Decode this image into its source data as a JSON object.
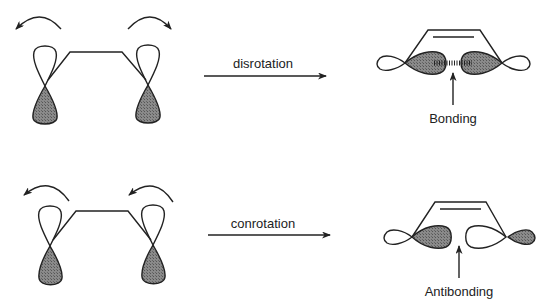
{
  "colors": {
    "ink": "#222222",
    "shaded_lobe": "#777777",
    "background": "#ffffff"
  },
  "top_row": {
    "reactant": {
      "left_rotation": "counterclockwise",
      "right_rotation": "clockwise"
    },
    "process_label": "disrotation",
    "product": {
      "interaction_label": "Bonding",
      "interaction_marker": "dashed-bond"
    }
  },
  "bottom_row": {
    "reactant": {
      "left_rotation": "counterclockwise",
      "right_rotation": "counterclockwise"
    },
    "process_label": "conrotation",
    "product": {
      "interaction_label": "Antibonding"
    }
  },
  "icons": {
    "rotation_arrow": "curved-arrow-icon",
    "reaction_arrow": "arrow-right-icon",
    "pointer_arrow": "arrow-up-icon"
  }
}
